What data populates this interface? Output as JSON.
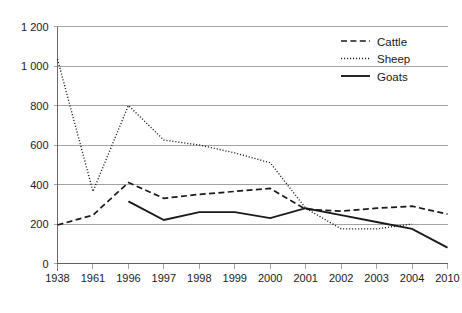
{
  "chart_data": {
    "type": "line",
    "title": "",
    "xlabel": "",
    "ylabel": "",
    "categories": [
      "1938",
      "1961",
      "1996",
      "1997",
      "1998",
      "1999",
      "2000",
      "2001",
      "2002",
      "2003",
      "2004",
      "2010"
    ],
    "ylim": [
      0,
      1200
    ],
    "yticks": [
      0,
      200,
      400,
      600,
      800,
      1000,
      1200
    ],
    "ytick_labels": [
      "0",
      "200",
      "400",
      "600",
      "800",
      "1 000",
      "1 200"
    ],
    "grid": true,
    "legend_position": "top-right",
    "series": [
      {
        "name": "Cattle",
        "style": "dashed",
        "color": "#1a1a1a",
        "values": [
          195,
          245,
          410,
          330,
          350,
          365,
          380,
          275,
          265,
          280,
          290,
          250
        ]
      },
      {
        "name": "Sheep",
        "style": "dotted",
        "color": "#1a1a1a",
        "values": [
          1035,
          365,
          800,
          625,
          600,
          560,
          510,
          280,
          175,
          175,
          200,
          null
        ]
      },
      {
        "name": "Goats",
        "style": "solid",
        "color": "#1a1a1a",
        "values": [
          null,
          null,
          315,
          220,
          260,
          260,
          230,
          280,
          245,
          210,
          175,
          80
        ]
      }
    ]
  },
  "legend": {
    "items": [
      {
        "label": "Cattle"
      },
      {
        "label": "Sheep"
      },
      {
        "label": "Goats"
      }
    ]
  }
}
